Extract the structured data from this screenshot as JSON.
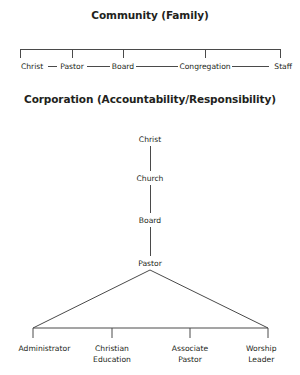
{
  "page": {
    "width": 300,
    "height": 375,
    "background": "#ffffff",
    "line_color": "#4a4a4a",
    "text_color": "#231f20"
  },
  "community": {
    "title_line1": "Community",
    "title_line2": "(Family)",
    "nodes": [
      {
        "label": "Christ",
        "x": 21,
        "align": "left-anchor"
      },
      {
        "label": "Pastor",
        "x": 72,
        "align": "center"
      },
      {
        "label": "Board",
        "x": 123,
        "align": "center"
      },
      {
        "label": "Congregation",
        "x": 205,
        "align": "center"
      },
      {
        "label": "Staff",
        "x": 292,
        "align": "right-anchor"
      }
    ],
    "bracket": {
      "y_top": 49,
      "y_tick_bottom": 58,
      "x_left": 20,
      "x_right": 280,
      "tick_x": [
        20,
        72,
        123,
        205,
        280
      ]
    },
    "connector_y": 66
  },
  "corporation": {
    "title_line1": "Corporation",
    "title_line2": "(Accountability/Responsibility)",
    "chain": [
      {
        "label": "Christ",
        "y": 139
      },
      {
        "label": "Church",
        "y": 178
      },
      {
        "label": "Board",
        "y": 220
      },
      {
        "label": "Pastor",
        "y": 263
      }
    ],
    "chain_x": 150,
    "fan": {
      "apex_x": 150,
      "apex_y": 270,
      "bar_y": 328,
      "x_left": 33,
      "x_right": 268,
      "tick_bottom": 338,
      "tick_x": [
        33,
        112,
        190,
        268
      ]
    },
    "leaves": [
      {
        "line1": "Administrator",
        "line2": "",
        "x": 33,
        "align": "left-anchor"
      },
      {
        "line1": "Christian",
        "line2": "Education",
        "x": 112,
        "align": "center"
      },
      {
        "line1": "Associate",
        "line2": "Pastor",
        "x": 190,
        "align": "center"
      },
      {
        "line1": "Worship",
        "line2": "Leader",
        "x": 268,
        "align": "right-anchor"
      }
    ],
    "leaf_label_y": 343
  }
}
